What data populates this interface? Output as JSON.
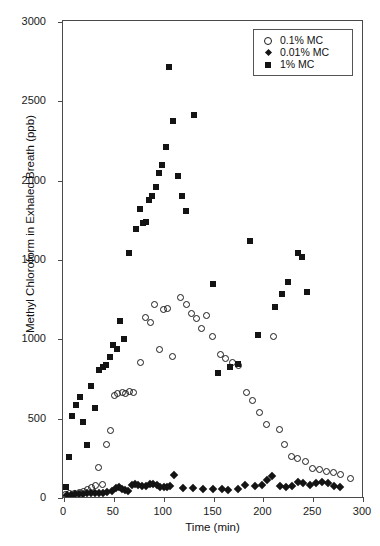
{
  "chart_data": {
    "type": "scatter",
    "title": "",
    "xlabel": "Time (min)",
    "ylabel": "Methyl Chloroform in Exhaled Breath (ppb)",
    "xlim": [
      0,
      300
    ],
    "ylim": [
      0,
      3000
    ],
    "xticks": [
      0,
      50,
      100,
      150,
      200,
      250,
      300
    ],
    "yticks": [
      0,
      500,
      1000,
      1500,
      2000,
      2500,
      3000
    ],
    "grid": false,
    "legend_position": "top-right",
    "series": [
      {
        "name": "0.1% MC",
        "marker": "open-circle",
        "color": "#1a1a1a",
        "points": [
          [
            3,
            15
          ],
          [
            7,
            20
          ],
          [
            12,
            25
          ],
          [
            17,
            30
          ],
          [
            21,
            35
          ],
          [
            25,
            45
          ],
          [
            29,
            60
          ],
          [
            33,
            75
          ],
          [
            36,
            185
          ],
          [
            40,
            80
          ],
          [
            44,
            330
          ],
          [
            48,
            420
          ],
          [
            52,
            640
          ],
          [
            55,
            650
          ],
          [
            60,
            660
          ],
          [
            63,
            655
          ],
          [
            67,
            665
          ],
          [
            71,
            660
          ],
          [
            78,
            850
          ],
          [
            83,
            1130
          ],
          [
            88,
            1100
          ],
          [
            92,
            1215
          ],
          [
            97,
            930
          ],
          [
            101,
            1180
          ],
          [
            105,
            1190
          ],
          [
            110,
            885
          ],
          [
            118,
            1260
          ],
          [
            124,
            1215
          ],
          [
            129,
            1155
          ],
          [
            134,
            1125
          ],
          [
            139,
            1060
          ],
          [
            144,
            1145
          ],
          [
            150,
            1010
          ],
          [
            158,
            900
          ],
          [
            163,
            870
          ],
          [
            170,
            850
          ],
          [
            176,
            830
          ],
          [
            184,
            660
          ],
          [
            190,
            610
          ],
          [
            197,
            530
          ],
          [
            204,
            455
          ],
          [
            211,
            1010
          ],
          [
            217,
            425
          ],
          [
            222,
            330
          ],
          [
            229,
            255
          ],
          [
            235,
            245
          ],
          [
            243,
            225
          ],
          [
            250,
            180
          ],
          [
            257,
            175
          ],
          [
            264,
            160
          ],
          [
            271,
            155
          ],
          [
            278,
            140
          ],
          [
            288,
            115
          ]
        ]
      },
      {
        "name": "0.01% MC",
        "marker": "filled-diamond",
        "color": "#141414",
        "points": [
          [
            4,
            10
          ],
          [
            8,
            14
          ],
          [
            12,
            16
          ],
          [
            16,
            20
          ],
          [
            20,
            22
          ],
          [
            24,
            25
          ],
          [
            28,
            28
          ],
          [
            32,
            25
          ],
          [
            36,
            24
          ],
          [
            40,
            26
          ],
          [
            44,
            30
          ],
          [
            49,
            35
          ],
          [
            53,
            55
          ],
          [
            56,
            62
          ],
          [
            59,
            50
          ],
          [
            62,
            45
          ],
          [
            65,
            38
          ],
          [
            69,
            75
          ],
          [
            72,
            80
          ],
          [
            75,
            78
          ],
          [
            79,
            72
          ],
          [
            83,
            70
          ],
          [
            87,
            85
          ],
          [
            90,
            82
          ],
          [
            94,
            78
          ],
          [
            97,
            60
          ],
          [
            101,
            60
          ],
          [
            104,
            62
          ],
          [
            107,
            72
          ],
          [
            111,
            140
          ],
          [
            120,
            55
          ],
          [
            130,
            58
          ],
          [
            140,
            52
          ],
          [
            150,
            50
          ],
          [
            160,
            48
          ],
          [
            166,
            46
          ],
          [
            176,
            52
          ],
          [
            183,
            78
          ],
          [
            193,
            72
          ],
          [
            200,
            76
          ],
          [
            205,
            105
          ],
          [
            210,
            130
          ],
          [
            218,
            68
          ],
          [
            224,
            66
          ],
          [
            230,
            70
          ],
          [
            236,
            95
          ],
          [
            241,
            90
          ],
          [
            248,
            78
          ],
          [
            254,
            88
          ],
          [
            260,
            92
          ],
          [
            266,
            86
          ],
          [
            272,
            72
          ],
          [
            278,
            60
          ]
        ]
      },
      {
        "name": "1% MC",
        "marker": "filled-square",
        "color": "#141414",
        "points": [
          [
            3,
            60
          ],
          [
            6,
            255
          ],
          [
            9,
            510
          ],
          [
            13,
            580
          ],
          [
            17,
            630
          ],
          [
            20,
            470
          ],
          [
            24,
            330
          ],
          [
            28,
            700
          ],
          [
            32,
            560
          ],
          [
            36,
            800
          ],
          [
            40,
            820
          ],
          [
            43,
            830
          ],
          [
            47,
            880
          ],
          [
            50,
            960
          ],
          [
            54,
            930
          ],
          [
            57,
            1110
          ],
          [
            61,
            995
          ],
          [
            66,
            1540
          ],
          [
            73,
            1690
          ],
          [
            77,
            1815
          ],
          [
            80,
            1730
          ],
          [
            83,
            1735
          ],
          [
            86,
            1875
          ],
          [
            89,
            1900
          ],
          [
            93,
            1955
          ],
          [
            96,
            2045
          ],
          [
            99,
            2095
          ],
          [
            103,
            2205
          ],
          [
            106,
            2710
          ],
          [
            110,
            2370
          ],
          [
            115,
            2025
          ],
          [
            119,
            1900
          ],
          [
            123,
            1805
          ],
          [
            131,
            2405
          ],
          [
            150,
            1340
          ],
          [
            156,
            780
          ],
          [
            168,
            820
          ],
          [
            176,
            840
          ],
          [
            188,
            1615
          ],
          [
            196,
            1020
          ],
          [
            213,
            1200
          ],
          [
            220,
            1280
          ],
          [
            226,
            1355
          ],
          [
            236,
            1540
          ],
          [
            240,
            1510
          ],
          [
            245,
            1290
          ]
        ]
      }
    ]
  },
  "legend": {
    "items": [
      {
        "label": "0.1% MC",
        "marker": "open-circle"
      },
      {
        "label": "0.01% MC",
        "marker": "filled-diamond"
      },
      {
        "label": "1% MC",
        "marker": "filled-square"
      }
    ]
  },
  "axes": {
    "x_title": "Time (min)",
    "y_title": "Methyl Chloroform in Exhaled Breath (ppb)",
    "x_tick_labels": [
      "0",
      "50",
      "100",
      "150",
      "200",
      "250",
      "300"
    ],
    "y_tick_labels": [
      "0",
      "500",
      "1000",
      "1500",
      "2000",
      "2500",
      "3000"
    ]
  }
}
